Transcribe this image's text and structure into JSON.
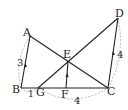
{
  "diagram": {
    "points": {
      "A": {
        "label": "A",
        "x": 30,
        "y": 36
      },
      "B": {
        "label": "B",
        "x": 21,
        "y": 88
      },
      "G": {
        "label": "G",
        "x": 38,
        "y": 88
      },
      "F": {
        "label": "F",
        "x": 66,
        "y": 88
      },
      "C": {
        "label": "C",
        "x": 108,
        "y": 88
      },
      "D": {
        "label": "D",
        "x": 118,
        "y": 18
      },
      "E": {
        "label": "E",
        "x": 68,
        "y": 61
      }
    },
    "measures": {
      "AB": "3",
      "BG": "1",
      "GC": "4",
      "CD": "4"
    }
  }
}
